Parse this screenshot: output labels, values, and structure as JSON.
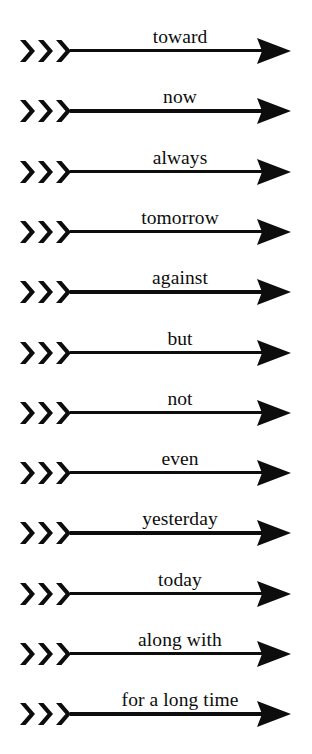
{
  "canvas": {
    "width": 312,
    "height": 754,
    "background_color": "#ffffff",
    "ink_color": "#0d0d0d"
  },
  "diagram": {
    "type": "arrow-word-list",
    "row_count": 12,
    "first_row_center_y": 49,
    "row_pitch": 60.3,
    "arrow": {
      "fletching_icon": "triple-chevron-icon",
      "fletching_chevron_count": 3,
      "shaft_icon": "horizontal-line-icon",
      "head_icon": "solid-triangle-right-icon"
    },
    "rows": [
      {
        "label": "toward"
      },
      {
        "label": "now"
      },
      {
        "label": "always"
      },
      {
        "label": "tomorrow"
      },
      {
        "label": "against"
      },
      {
        "label": "but"
      },
      {
        "label": "not"
      },
      {
        "label": "even"
      },
      {
        "label": "yesterday"
      },
      {
        "label": "today"
      },
      {
        "label": "along with"
      },
      {
        "label": "for a long time"
      }
    ]
  }
}
